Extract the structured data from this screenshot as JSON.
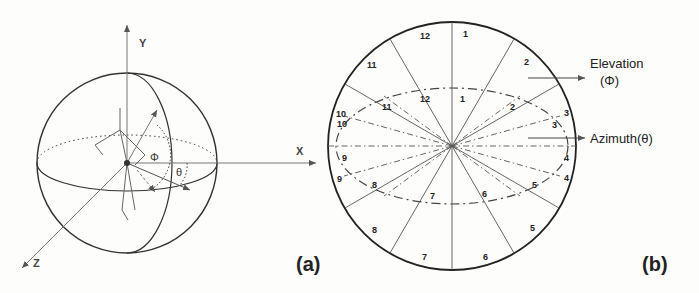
{
  "figure": {
    "panel_a": {
      "label": "(a)",
      "axes": {
        "y": "Y",
        "x": "X",
        "z": "Z"
      },
      "angles": {
        "elevation": "Φ",
        "azimuth": "θ"
      }
    },
    "panel_b": {
      "label": "(b)",
      "outer_sectors": [
        "1",
        "2",
        "3",
        "4",
        "5",
        "6",
        "7",
        "8",
        "9",
        "10",
        "11",
        "12"
      ],
      "inner_sectors": [
        "1",
        "2",
        "3",
        "4",
        "5",
        "6",
        "7",
        "8",
        "9",
        "10",
        "11",
        "12"
      ],
      "annotations": {
        "elevation": "Elevation",
        "elevation_symbol": "(Φ)",
        "azimuth": "Azimuth(θ)"
      }
    }
  }
}
